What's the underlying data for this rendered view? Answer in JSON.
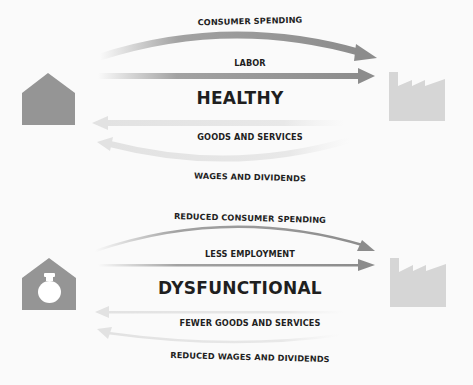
{
  "healthy": {
    "title": "HEALTHY",
    "flows": {
      "consumer_spending": "CONSUMER SPENDING",
      "labor": "LABOR",
      "goods_services": "GOODS AND SERVICES",
      "wages_dividends": "WAGES AND DIVIDENDS"
    },
    "left_icon": "house-icon",
    "right_icon": "factory-icon"
  },
  "dysfunctional": {
    "title": "DYSFUNCTIONAL",
    "flows": {
      "consumer_spending": "REDUCED CONSUMER SPENDING",
      "labor": "LESS EMPLOYMENT",
      "goods_services": "FEWER GOODS AND SERVICES",
      "wages_dividends": "REDUCED WAGES AND DIVIDENDS"
    },
    "left_icon": "house-with-moneybag-icon",
    "right_icon": "factory-icon"
  },
  "colors": {
    "house": "#959595",
    "factory": "#d6d6d6",
    "arrow_forward": "#8c8c8c",
    "arrow_return": "#e6e6e6",
    "text": "#1f1f1f"
  }
}
